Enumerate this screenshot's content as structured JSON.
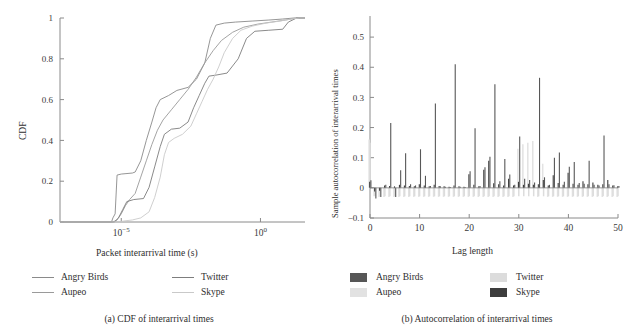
{
  "figure": {
    "panels": [
      {
        "id": "a",
        "caption": "(a)  CDF of interarrival times",
        "xlabel": "Packet interarrival time (s)",
        "ylabel": "CDF"
      },
      {
        "id": "b",
        "caption": "(b)  Autocorrelation of interarrival times",
        "xlabel": "Lag length",
        "ylabel": "Sample autocorrelation of interarrival times"
      }
    ]
  },
  "legend_a": {
    "items": [
      {
        "label": "Angry Birds",
        "color": "#8a8a8a",
        "col": 0,
        "row": 0
      },
      {
        "label": "Aupeo",
        "color": "#9a9a9a",
        "col": 0,
        "row": 1
      },
      {
        "label": "Twitter",
        "color": "#7d7d7d",
        "col": 1,
        "row": 0
      },
      {
        "label": "Skype",
        "color": "#c9c9c9",
        "col": 1,
        "row": 1
      }
    ]
  },
  "legend_b": {
    "items": [
      {
        "label": "Angry Birds",
        "color": "#575757",
        "col": 0,
        "row": 0
      },
      {
        "label": "Aupeo",
        "color": "#e2e2e2",
        "col": 0,
        "row": 1
      },
      {
        "label": "Twitter",
        "color": "#dcdcdc",
        "col": 1,
        "row": 0
      },
      {
        "label": "Skype",
        "color": "#3d3d3d",
        "col": 1,
        "row": 1
      }
    ]
  },
  "chart_data": [
    {
      "type": "line",
      "title": "(a) CDF of interarrival times",
      "xlabel": "Packet interarrival time (s)",
      "ylabel": "CDF",
      "xscale": "log",
      "xlim": [
        -7.2,
        1.6
      ],
      "ylim": [
        0,
        1
      ],
      "xticks": [
        -5,
        0
      ],
      "xticklabels": [
        "10−5",
        "10⁰"
      ],
      "yticks": [
        0,
        0.2,
        0.4,
        0.6,
        0.8,
        1
      ],
      "yticklabels": [
        "0",
        "0.2",
        "0.4",
        "0.6",
        "0.8",
        "1"
      ],
      "grid": false,
      "legend_position": "below",
      "series": [
        {
          "name": "Angry Birds",
          "color": "#8a8a8a",
          "points": [
            [
              -7.2,
              0.0
            ],
            [
              -5.35,
              0.0
            ],
            [
              -5.3,
              0.02
            ],
            [
              -5.22,
              0.04
            ],
            [
              -5.15,
              0.23
            ],
            [
              -5.0,
              0.235
            ],
            [
              -4.6,
              0.24
            ],
            [
              -4.5,
              0.245
            ],
            [
              -4.3,
              0.3
            ],
            [
              -4.1,
              0.4
            ],
            [
              -3.9,
              0.49
            ],
            [
              -3.75,
              0.56
            ],
            [
              -3.6,
              0.6
            ],
            [
              -3.3,
              0.62
            ],
            [
              -3.0,
              0.645
            ],
            [
              -2.6,
              0.66
            ],
            [
              -2.3,
              0.7
            ],
            [
              -2.0,
              0.78
            ],
            [
              -1.8,
              0.9
            ],
            [
              -1.6,
              0.965
            ],
            [
              -1.3,
              0.975
            ],
            [
              -0.9,
              0.98
            ],
            [
              -0.3,
              0.985
            ],
            [
              0.3,
              0.99
            ],
            [
              0.8,
              0.995
            ],
            [
              1.2,
              1.0
            ],
            [
              1.6,
              1.0
            ]
          ]
        },
        {
          "name": "Aupeo",
          "color": "#9a9a9a",
          "points": [
            [
              -7.2,
              0.0
            ],
            [
              -5.3,
              0.0
            ],
            [
              -5.15,
              0.01
            ],
            [
              -5.0,
              0.04
            ],
            [
              -4.85,
              0.08
            ],
            [
              -4.7,
              0.11
            ],
            [
              -4.5,
              0.14
            ],
            [
              -4.3,
              0.22
            ],
            [
              -4.1,
              0.3
            ],
            [
              -3.9,
              0.38
            ],
            [
              -3.7,
              0.45
            ],
            [
              -3.5,
              0.5
            ],
            [
              -3.2,
              0.55
            ],
            [
              -2.9,
              0.6
            ],
            [
              -2.6,
              0.65
            ],
            [
              -2.3,
              0.71
            ],
            [
              -2.0,
              0.78
            ],
            [
              -1.7,
              0.84
            ],
            [
              -1.4,
              0.89
            ],
            [
              -1.0,
              0.93
            ],
            [
              -0.6,
              0.955
            ],
            [
              -0.1,
              0.97
            ],
            [
              0.4,
              0.98
            ],
            [
              0.9,
              0.99
            ],
            [
              1.3,
              1.0
            ],
            [
              1.6,
              1.0
            ]
          ]
        },
        {
          "name": "Twitter",
          "color": "#7d7d7d",
          "points": [
            [
              -7.2,
              0.0
            ],
            [
              -5.25,
              0.0
            ],
            [
              -5.1,
              0.02
            ],
            [
              -4.95,
              0.06
            ],
            [
              -4.8,
              0.1
            ],
            [
              -4.55,
              0.11
            ],
            [
              -4.2,
              0.115
            ],
            [
              -4.0,
              0.17
            ],
            [
              -3.8,
              0.27
            ],
            [
              -3.6,
              0.37
            ],
            [
              -3.45,
              0.43
            ],
            [
              -3.2,
              0.455
            ],
            [
              -2.9,
              0.46
            ],
            [
              -2.6,
              0.49
            ],
            [
              -2.4,
              0.56
            ],
            [
              -2.2,
              0.62
            ],
            [
              -2.0,
              0.68
            ],
            [
              -1.85,
              0.715
            ],
            [
              -1.6,
              0.72
            ],
            [
              -1.2,
              0.73
            ],
            [
              -0.8,
              0.8
            ],
            [
              -0.5,
              0.9
            ],
            [
              -0.2,
              0.935
            ],
            [
              0.3,
              0.94
            ],
            [
              0.8,
              0.945
            ],
            [
              1.0,
              0.98
            ],
            [
              1.3,
              1.0
            ],
            [
              1.6,
              1.0
            ]
          ]
        },
        {
          "name": "Skype",
          "color": "#c9c9c9",
          "points": [
            [
              -7.2,
              0.0
            ],
            [
              -5.1,
              0.0
            ],
            [
              -4.9,
              0.005
            ],
            [
              -4.6,
              0.01
            ],
            [
              -4.3,
              0.02
            ],
            [
              -4.0,
              0.05
            ],
            [
              -3.8,
              0.12
            ],
            [
              -3.6,
              0.22
            ],
            [
              -3.45,
              0.33
            ],
            [
              -3.3,
              0.39
            ],
            [
              -3.1,
              0.41
            ],
            [
              -2.8,
              0.43
            ],
            [
              -2.5,
              0.47
            ],
            [
              -2.3,
              0.53
            ],
            [
              -2.1,
              0.59
            ],
            [
              -1.9,
              0.65
            ],
            [
              -1.7,
              0.7
            ],
            [
              -1.5,
              0.76
            ],
            [
              -1.3,
              0.83
            ],
            [
              -1.0,
              0.9
            ],
            [
              -0.7,
              0.94
            ],
            [
              -0.3,
              0.96
            ],
            [
              0.2,
              0.975
            ],
            [
              0.7,
              0.985
            ],
            [
              1.1,
              0.995
            ],
            [
              1.4,
              1.0
            ],
            [
              1.6,
              1.0
            ]
          ]
        }
      ]
    },
    {
      "type": "bar",
      "title": "(b) Autocorrelation of interarrival times",
      "xlabel": "Lag length",
      "ylabel": "Sample autocorrelation of interarrival times",
      "xlim": [
        0,
        50
      ],
      "ylim": [
        -0.1,
        0.57
      ],
      "xticks": [
        0,
        10,
        20,
        30,
        40,
        50
      ],
      "xticklabels": [
        "0",
        "10",
        "20",
        "30",
        "40",
        "50"
      ],
      "yticks": [
        -0.1,
        0,
        0.1,
        0.2,
        0.3,
        0.4,
        0.5
      ],
      "yticklabels": [
        "−0.1",
        "0",
        "0.1",
        "0.2",
        "0.3",
        "0.4",
        "0.5"
      ],
      "grid": false,
      "legend_position": "below",
      "lags": [
        0,
        1,
        2,
        3,
        4,
        5,
        6,
        7,
        8,
        9,
        10,
        11,
        12,
        13,
        14,
        15,
        16,
        17,
        18,
        19,
        20,
        21,
        22,
        23,
        24,
        25,
        26,
        27,
        28,
        29,
        30,
        31,
        32,
        33,
        34,
        35,
        36,
        37,
        38,
        39,
        40,
        41,
        42,
        43,
        44,
        45,
        46,
        47,
        48,
        49,
        50
      ],
      "series": [
        {
          "name": "Angry Birds",
          "color": "#575757",
          "values": [
            0.025,
            -0.035,
            -0.03,
            0.01,
            0.215,
            -0.03,
            0.058,
            0.115,
            0.012,
            0.008,
            0.128,
            0.04,
            0.006,
            0.28,
            0.005,
            0.004,
            0.003,
            0.41,
            0.004,
            0.003,
            0.055,
            0.198,
            0.006,
            0.068,
            0.103,
            0.344,
            0.022,
            0.096,
            0.044,
            0.01,
            0.17,
            0.03,
            0.026,
            0.018,
            0.365,
            0.035,
            0.01,
            0.1,
            0.117,
            0.02,
            0.07,
            0.086,
            0.016,
            0.014,
            0.09,
            0.01,
            0.008,
            0.174,
            0.012,
            0.009,
            0.006
          ]
        },
        {
          "name": "Aupeo",
          "color": "#e2e2e2",
          "values": [
            0.16,
            -0.028,
            -0.03,
            -0.03,
            -0.03,
            -0.03,
            -0.03,
            -0.03,
            -0.03,
            -0.03,
            -0.03,
            -0.03,
            -0.03,
            -0.03,
            -0.03,
            -0.03,
            -0.03,
            -0.03,
            -0.03,
            -0.03,
            -0.03,
            -0.03,
            -0.03,
            -0.03,
            -0.03,
            -0.03,
            -0.03,
            -0.03,
            -0.03,
            -0.03,
            0.13,
            0.145,
            0.15,
            0.155,
            -0.03,
            0.08,
            -0.03,
            -0.03,
            -0.03,
            -0.03,
            -0.03,
            -0.03,
            -0.03,
            -0.03,
            -0.03,
            -0.03,
            -0.03,
            -0.03,
            -0.03,
            -0.03,
            -0.03
          ]
        },
        {
          "name": "Twitter",
          "color": "#dcdcdc",
          "values": [
            0.15,
            -0.026,
            -0.028,
            -0.028,
            -0.028,
            -0.028,
            -0.028,
            -0.028,
            -0.028,
            -0.028,
            -0.028,
            -0.028,
            -0.028,
            -0.028,
            -0.028,
            -0.028,
            -0.028,
            -0.028,
            -0.028,
            -0.028,
            -0.028,
            -0.028,
            -0.028,
            -0.028,
            -0.028,
            -0.028,
            -0.028,
            -0.028,
            -0.028,
            -0.028,
            -0.028,
            -0.028,
            -0.028,
            -0.028,
            -0.028,
            -0.028,
            -0.028,
            -0.028,
            -0.028,
            -0.028,
            -0.028,
            -0.028,
            -0.028,
            -0.028,
            -0.028,
            -0.028,
            -0.028,
            -0.028,
            -0.028,
            -0.028,
            -0.028
          ]
        },
        {
          "name": "Skype",
          "color": "#3d3d3d",
          "values": [
            0.02,
            -0.012,
            -0.01,
            0.008,
            0.006,
            0.005,
            0.01,
            0.008,
            0.006,
            0.005,
            0.012,
            0.008,
            0.005,
            0.01,
            0.006,
            0.005,
            0.004,
            0.008,
            0.005,
            0.004,
            0.045,
            0.01,
            0.005,
            0.06,
            0.09,
            0.015,
            0.012,
            0.008,
            0.03,
            0.008,
            0.02,
            0.01,
            0.014,
            0.01,
            0.012,
            0.026,
            0.008,
            0.042,
            0.016,
            0.01,
            0.05,
            0.014,
            0.01,
            0.022,
            0.012,
            0.018,
            0.01,
            0.012,
            0.026,
            0.008,
            0.005
          ]
        }
      ]
    }
  ]
}
